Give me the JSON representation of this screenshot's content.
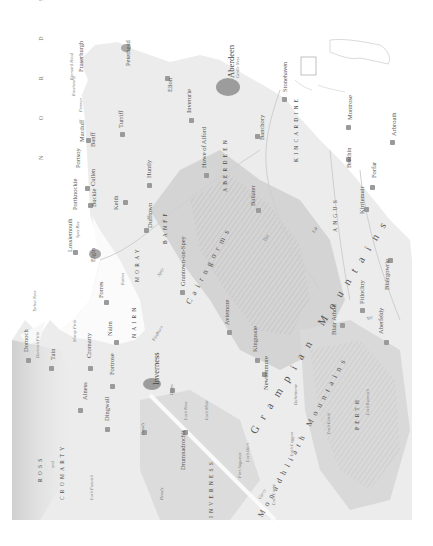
{
  "map": {
    "orientation": "rotated 90° (north to the left)",
    "sea": "N O R D S E E",
    "colors": {
      "paper": "#ffffff",
      "land": "#ececec",
      "terrain_dark": "#bdbdbd",
      "settlement": "#9c9c9c",
      "text": "#555555"
    },
    "regions": {
      "ross": "ROSS",
      "and": "and",
      "cromarty": "CROMARTY",
      "nairn": "NAIRN",
      "moray": "MORAY",
      "banff": "BANFF",
      "aberdeen": "ABERDEEN",
      "kincardine": "KINCARDINE",
      "angus": "ANGUS",
      "perth": "PERTH",
      "inverness": "INVERNESS"
    },
    "ranges": {
      "cairngorms": "Cairngorms",
      "grampian": "Grampian Mountains",
      "monadhliath": "Monadhliath Mountains",
      "monadhliath_north": "Monadhliath"
    },
    "water": {
      "tarbat_ness": "Tarbat Ness",
      "moray_firth": "Moray Firth",
      "dornoch_firth": "Dornoch Firth",
      "kinnaird_head": "Kinnaird Head",
      "girdle_ness": "Girdle Ness",
      "spey_bay": "Spey Bay",
      "loch_ness": "Loch Ness",
      "loch_mhor": "Loch Mhór",
      "loch_oich": "Loch Oich",
      "loch_lochy": "Loch Lochy",
      "loch_laggan": "Loch Laggan",
      "loch_ericht": "Loch Ericht",
      "loch_rannoch": "Loch Rannoch",
      "loch_fannich": "Loch Fannich",
      "findhorn": "Findhorn",
      "spey": "Spey",
      "deveron": "Deveron",
      "dee": "Dee",
      "esk": "Esk",
      "tay": "Tay",
      "beauly": "Beauly",
      "nairn_river": "Nairn",
      "tummel": "Tummel",
      "garry": "Garry"
    },
    "towns": {
      "dornoch": "Dornoch",
      "tain": "Tain",
      "alness": "Alness",
      "cromarty": "Cromarty",
      "dingwall": "Dingwall",
      "fortrose": "Fortrose",
      "nairn": "Nairn",
      "forres": "Forres",
      "elgin": "Elgin",
      "lossiemouth": "Lossiemouth",
      "buckie": "Buckie",
      "portknockie": "Portknockie",
      "cullen": "Cullen",
      "portsoy": "Portsoy",
      "banff": "Banff",
      "macduff": "Macduff",
      "pennan": "Pennan",
      "rosehearty": "Rosehearty",
      "fraserburgh": "Fraserburgh",
      "peterhead": "Peterhead",
      "ellon": "Ellon",
      "turriff": "Turriff",
      "huntly": "Huntly",
      "keith": "Keith",
      "dufftown": "Dufftown",
      "rothes": "Rothes",
      "grantown": "Grantown-on-Spey",
      "inverurie": "Inverurie",
      "howe_of_alford": "Howe of Alford",
      "aberdeen": "Aberdeen",
      "stonehaven": "Stonehaven",
      "banchory": "Banchory",
      "ballater": "Ballater",
      "montrose": "Montrose",
      "brechin": "Brechin",
      "arbroath": "Arbroath",
      "forfar": "Forfar",
      "kirriemuir": "Kirriemuir",
      "blairgowrie": "Blairgowrie",
      "pitlochry": "Pitlochry",
      "aberfeldy": "Aberfeldy",
      "blair_atholl": "Blair Atholl",
      "aviemore": "Aviemore",
      "kingussie": "Kingussie",
      "newtonmore": "Newtonmore",
      "dalwhinnie": "Dalwhinnie",
      "inverness": "Inverness",
      "beauly": "Beauly",
      "dores": "Dores",
      "drumnadrochit": "Drumnadrochit",
      "fort_augustus": "Fort Augustus"
    }
  }
}
